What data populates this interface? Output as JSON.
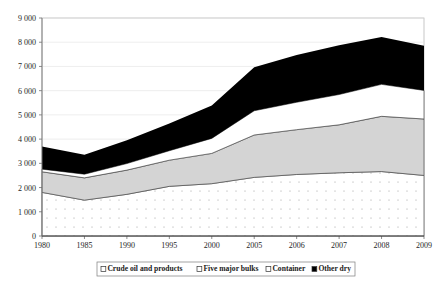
{
  "chart_data": {
    "type": "area",
    "title": "",
    "subtitle": "",
    "xlabel": "",
    "ylabel": "",
    "stacked": true,
    "grid": true,
    "legend_position": "bottom",
    "categories": [
      "1980",
      "1985",
      "1990",
      "1995",
      "2000",
      "2005",
      "2006",
      "2007",
      "2008",
      "2009"
    ],
    "x": [
      "1980",
      "1985",
      "1990",
      "1995",
      "2000",
      "2005",
      "2006",
      "2007",
      "2008",
      "2009"
    ],
    "ylim": [
      0,
      9000
    ],
    "yticks": [
      0,
      1000,
      2000,
      3000,
      4000,
      5000,
      6000,
      7000,
      8000,
      9000
    ],
    "ytick_labels": [
      "0",
      "1 000",
      "2 000",
      "3 000",
      "4 000",
      "5 000",
      "6 000",
      "7 000",
      "8 000",
      "9 000"
    ],
    "series": [
      {
        "name": "Crude oil and products",
        "color": "#ffffff",
        "pattern": "dotted",
        "values": [
          1800,
          1480,
          1720,
          2050,
          2160,
          2420,
          2540,
          2610,
          2660,
          2500
        ]
      },
      {
        "name": "Five major bulks",
        "color": "#d4d4d4",
        "pattern": "solid",
        "values": [
          850,
          920,
          1000,
          1080,
          1250,
          1750,
          1850,
          1980,
          2280,
          2330
        ]
      },
      {
        "name": "Container",
        "color": "#ffffff",
        "pattern": "none",
        "values": [
          110,
          150,
          270,
          390,
          620,
          1000,
          1130,
          1250,
          1320,
          1180
        ]
      },
      {
        "name": "Other dry",
        "color": "#000000",
        "pattern": "solid",
        "values": [
          940,
          800,
          960,
          1120,
          1360,
          1800,
          1950,
          2030,
          1960,
          1840
        ]
      }
    ],
    "cumulative_tops": {
      "crude_oil_and_products": [
        1800,
        1480,
        1720,
        2050,
        2160,
        2420,
        2540,
        2610,
        2660,
        2500
      ],
      "five_major_bulks": [
        2650,
        2400,
        2720,
        3130,
        3410,
        4170,
        4390,
        4590,
        4940,
        4830
      ],
      "container": [
        2760,
        2550,
        2990,
        3520,
        4030,
        5170,
        5520,
        5840,
        6260,
        6010
      ],
      "other_dry": [
        3700,
        3350,
        3950,
        4640,
        5390,
        6970,
        7470,
        7870,
        8220,
        7850
      ]
    }
  },
  "legend": {
    "items": [
      {
        "label": "Crude oil and products",
        "marker": "open-square"
      },
      {
        "label": "Five major bulks",
        "marker": "open-square"
      },
      {
        "label": "Container",
        "marker": "open-square"
      },
      {
        "label": "Other dry",
        "marker": "filled-square"
      }
    ]
  }
}
